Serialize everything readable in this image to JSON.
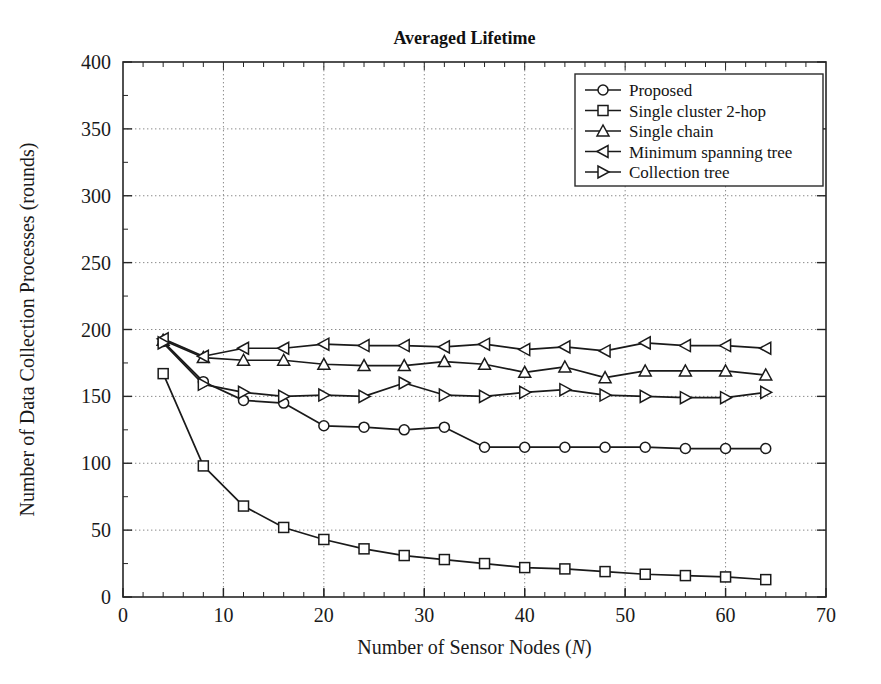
{
  "chart_data": {
    "type": "line",
    "title": "Averaged Lifetime",
    "xlabel": "Number of Sensor Nodes (N)",
    "xlabel_plain": "Number of Sensor Nodes (",
    "xlabel_italic": "N",
    "xlabel_tail": ")",
    "ylabel": "Number of Data Collection Processes (rounds)",
    "xlim": [
      0,
      70
    ],
    "ylim": [
      0,
      400
    ],
    "xticks": [
      0,
      10,
      20,
      30,
      40,
      50,
      60,
      70
    ],
    "yticks": [
      0,
      50,
      100,
      150,
      200,
      250,
      300,
      350,
      400
    ],
    "xtick_labels": [
      "0",
      "10",
      "20",
      "30",
      "40",
      "50",
      "60",
      "70"
    ],
    "ytick_labels": [
      "0",
      "50",
      "100",
      "150",
      "200",
      "250",
      "300",
      "350",
      "400"
    ],
    "x_minor_step": 2,
    "grid": true,
    "grid_style": "dotted",
    "legend_position": "top-right",
    "x": [
      4,
      8,
      12,
      16,
      20,
      24,
      28,
      32,
      36,
      40,
      44,
      48,
      52,
      56,
      60,
      64
    ],
    "series": [
      {
        "name": "Proposed",
        "marker": "circle",
        "values": [
          191,
          161,
          147,
          145,
          128,
          127,
          125,
          127,
          112,
          112,
          112,
          112,
          112,
          111,
          111,
          111
        ]
      },
      {
        "name": "Single cluster 2-hop",
        "marker": "square",
        "values": [
          167,
          98,
          68,
          52,
          43,
          36,
          31,
          28,
          25,
          22,
          21,
          19,
          17,
          16,
          15,
          13
        ]
      },
      {
        "name": "Single chain",
        "marker": "triangle-up",
        "values": [
          192,
          179,
          177,
          177,
          174,
          173,
          173,
          176,
          174,
          168,
          172,
          164,
          169,
          169,
          169,
          166
        ]
      },
      {
        "name": "Minimum spanning tree",
        "marker": "triangle-left",
        "values": [
          193,
          180,
          186,
          186,
          189,
          188,
          188,
          187,
          189,
          185,
          187,
          184,
          190,
          188,
          188,
          186
        ]
      },
      {
        "name": "Collection tree",
        "marker": "triangle-right",
        "values": [
          190,
          159,
          153,
          150,
          151,
          150,
          160,
          151,
          150,
          153,
          155,
          151,
          150,
          149,
          149,
          153
        ]
      }
    ]
  }
}
